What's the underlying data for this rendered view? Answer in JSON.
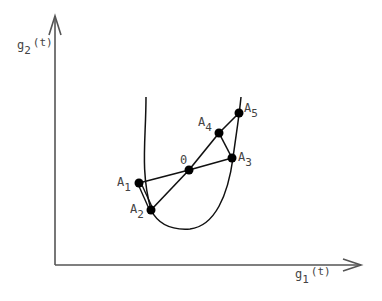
{
  "axes": {
    "x_label": {
      "main": "g",
      "sub": "1",
      "suffix": "(t)"
    },
    "y_label": {
      "main": "g",
      "sub": "2",
      "suffix": "(t)"
    }
  },
  "points": {
    "O": {
      "label": "0",
      "sub": ""
    },
    "A1": {
      "label": "A",
      "sub": "1"
    },
    "A2": {
      "label": "A",
      "sub": "2"
    },
    "A3": {
      "label": "A",
      "sub": "3"
    },
    "A4": {
      "label": "A",
      "sub": "4"
    },
    "A5": {
      "label": "A",
      "sub": "5"
    }
  },
  "segments": [
    [
      "A1",
      "O"
    ],
    [
      "O",
      "A3"
    ],
    [
      "A2",
      "O"
    ],
    [
      "O",
      "A4"
    ],
    [
      "A4",
      "A5"
    ],
    [
      "A4",
      "A3"
    ],
    [
      "A1",
      "A2"
    ]
  ],
  "colors": {
    "axis": "#555555",
    "curve": "#111111",
    "point": "#000000",
    "text": "#444444"
  }
}
